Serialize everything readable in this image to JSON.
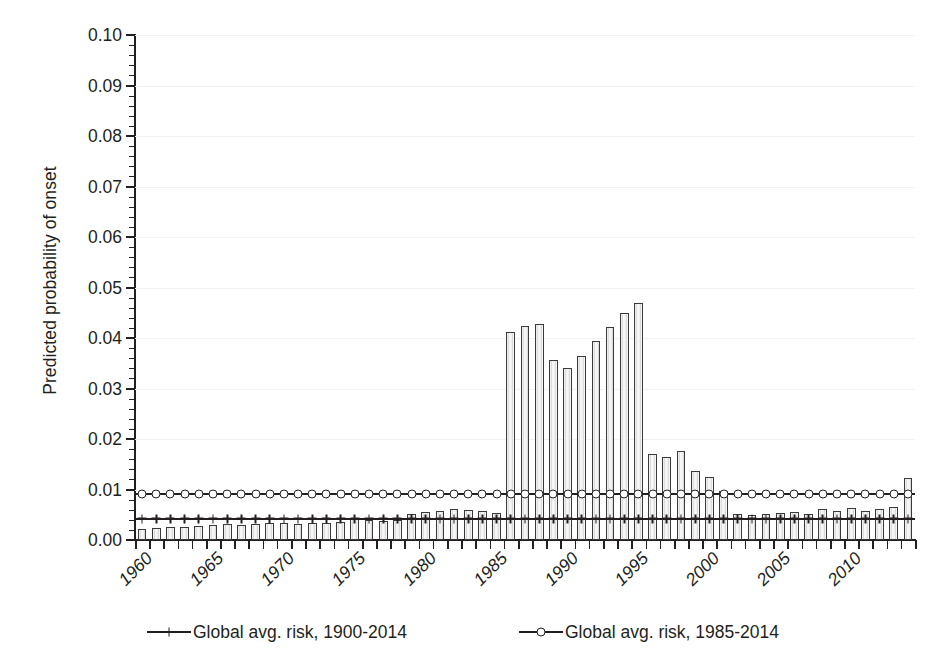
{
  "chart_data": {
    "type": "bar",
    "title": "",
    "xlabel": "",
    "ylabel": "Predicted probability of onset",
    "ylim": [
      0.0,
      0.1
    ],
    "ytick_step": 0.01,
    "yminor_step": 0.002,
    "grid": true,
    "legend_position": "bottom",
    "x_tick_labels": [
      "1960",
      "1965",
      "1970",
      "1975",
      "1980",
      "1985",
      "1990",
      "1995",
      "2000",
      "2005",
      "2010"
    ],
    "y_tick_labels": [
      "0.00",
      "0.01",
      "0.02",
      "0.03",
      "0.04",
      "0.05",
      "0.06",
      "0.07",
      "0.08",
      "0.09",
      "0.10"
    ],
    "categories": [
      1960,
      1961,
      1962,
      1963,
      1964,
      1965,
      1966,
      1967,
      1968,
      1969,
      1970,
      1971,
      1972,
      1973,
      1974,
      1975,
      1976,
      1977,
      1978,
      1979,
      1980,
      1981,
      1982,
      1983,
      1984,
      1985,
      1986,
      1987,
      1988,
      1989,
      1990,
      1991,
      1992,
      1993,
      1994,
      1995,
      1996,
      1997,
      1998,
      1999,
      2000,
      2001,
      2002,
      2003,
      2004,
      2005,
      2006,
      2007,
      2008,
      2009,
      2010,
      2011,
      2012,
      2013,
      2014
    ],
    "values": [
      0.0022,
      0.0024,
      0.0025,
      0.0026,
      0.0027,
      0.003,
      0.0031,
      0.003,
      0.0031,
      0.0033,
      0.0033,
      0.0032,
      0.0033,
      0.0034,
      0.0036,
      0.0044,
      0.0039,
      0.0037,
      0.0039,
      0.0052,
      0.0056,
      0.0057,
      0.0061,
      0.006,
      0.0057,
      0.0053,
      0.0412,
      0.0424,
      0.0427,
      0.0357,
      0.0341,
      0.0364,
      0.0395,
      0.0422,
      0.0449,
      0.0469,
      0.017,
      0.0165,
      0.0176,
      0.0136,
      0.0124,
      0.0098,
      0.0051,
      0.005,
      0.0052,
      0.0054,
      0.0056,
      0.0052,
      0.0061,
      0.0058,
      0.0063,
      0.0057,
      0.0061,
      0.0065,
      0.0122
    ],
    "series": [
      {
        "name": "Global avg. risk, 1900-2014",
        "type": "line",
        "marker": "cross",
        "constant_value": 0.0042
      },
      {
        "name": "Global avg. risk, 1985-2014",
        "type": "line",
        "marker": "open-circle",
        "constant_value": 0.0091
      }
    ],
    "bar_fill_color": "#efefef",
    "bar_edge_color": "#3a3a3a",
    "line_color": "#231f20"
  },
  "legend": {
    "items": [
      {
        "label": "Global avg. risk, 1900-2014",
        "marker": "cross-marker"
      },
      {
        "label": "Global avg. risk, 1985-2014",
        "marker": "circle-marker"
      }
    ]
  },
  "axes": {
    "y_title": "Predicted probability of onset"
  }
}
